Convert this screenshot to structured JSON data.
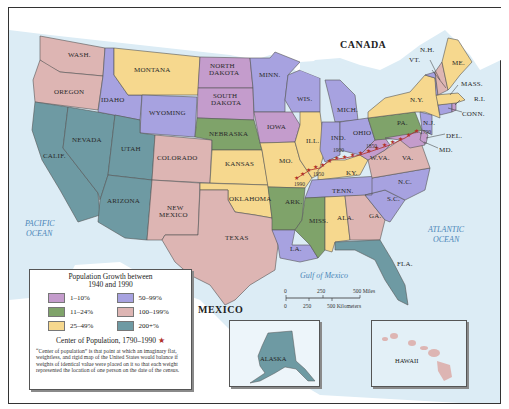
{
  "legend": {
    "title": "Population Growth between 1940 and 1990",
    "title_line1": "Population Growth between",
    "title_line2": "1940 and 1990",
    "items": [
      {
        "label": "1–10%",
        "color": "#c49ccc"
      },
      {
        "label": "50–99%",
        "color": "#a7a2e0"
      },
      {
        "label": "11–24%",
        "color": "#7fa36a"
      },
      {
        "label": "100–199%",
        "color": "#ddb5b3"
      },
      {
        "label": "25–49%",
        "color": "#f6d88e"
      },
      {
        "label": "200+%",
        "color": "#6e9aa3"
      }
    ],
    "center_label": "Center of Population, 1790–1990",
    "center_symbol": "★",
    "note": "“Center of population” is that point at which an imaginary flat, weightless, and rigid map of the United States would balance if weights of identical value were placed on it so that each weight represented the location of one person on the date of the census."
  },
  "map": {
    "countries": {
      "canada": "CANADA",
      "mexico": "MEXICO"
    },
    "water": {
      "pacific_1": "PACIFIC",
      "pacific_2": "OCEAN",
      "atlantic_1": "ATLANTIC",
      "atlantic_2": "OCEAN",
      "gulf": "Gulf of Mexico"
    },
    "states": {
      "wash": "WASH.",
      "oregon": "OREGON",
      "calif": "CALIF.",
      "nevada": "NEVADA",
      "idaho": "IDAHO",
      "montana": "MONTANA",
      "wyoming": "WYOMING",
      "utah": "UTAH",
      "arizona": "ARIZONA",
      "colorado": "COLORADO",
      "new_mexico_1": "NEW",
      "new_mexico_2": "MEXICO",
      "north_dakota_1": "NORTH",
      "north_dakota_2": "DAKOTA",
      "south_dakota_1": "SOUTH",
      "south_dakota_2": "DAKOTA",
      "nebraska": "NEBRASKA",
      "kansas": "KANSAS",
      "oklahoma": "OKLAHOMA",
      "texas": "TEXAS",
      "minn": "MINN.",
      "iowa": "IOWA",
      "mo": "MO.",
      "ark": "ARK.",
      "la": "LA.",
      "wis": "WIS.",
      "ill": "ILL.",
      "mich": "MICH.",
      "ind": "IND.",
      "ohio": "OHIO",
      "ky": "KY.",
      "tenn": "TENN.",
      "miss": "MISS.",
      "ala": "ALA.",
      "ga": "GA.",
      "fla": "FLA.",
      "sc": "S.C.",
      "nc": "N.C.",
      "va": "VA.",
      "wva": "W.VA.",
      "pa": "PA.",
      "ny": "N.Y.",
      "nj": "N.J.",
      "del": "DEL.",
      "md": "MD.",
      "conn": "CONN.",
      "ri": "R.I.",
      "mass": "MASS.",
      "vt": "VT.",
      "nh": "N.H.",
      "me": "ME.",
      "alaska": "ALASKA",
      "hawaii": "HAWAII"
    },
    "center_years": {
      "y1790": "1790",
      "y1850": "1850",
      "y1900": "1900",
      "y1950": "1950",
      "y1990": "1990"
    },
    "scale": {
      "miles_0": "0",
      "miles_250": "250",
      "miles_500": "500 Miles",
      "km_0": "0",
      "km_250": "250",
      "km_500": "500 Kilometers"
    }
  },
  "colors": {
    "c1_10": "#c49ccc",
    "c50_99": "#a7a2e0",
    "c11_24": "#7fa36a",
    "c100_199": "#ddb5b3",
    "c25_49": "#f6d88e",
    "c200": "#6e9aa3",
    "water": "#dcecf5",
    "land_foreign": "#ffffff",
    "star": "#b0322a"
  }
}
